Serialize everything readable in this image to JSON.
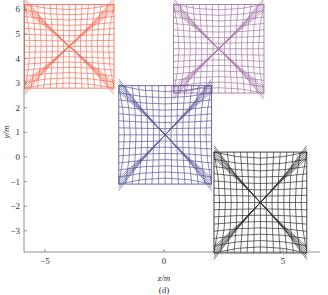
{
  "chart_data": {
    "type": "scatter",
    "title": "",
    "caption": "(d)",
    "xlabel": "z/m",
    "ylabel": "y/m",
    "xlim": [
      -6.0,
      6.5
    ],
    "ylim": [
      -3.9,
      6.2
    ],
    "xticks": [
      -5,
      0,
      5
    ],
    "xtick_labels": [
      "-5",
      "0",
      "5"
    ],
    "yticks": [
      -3,
      -2,
      -1,
      0,
      1,
      2,
      3,
      4,
      5,
      6
    ],
    "ytick_labels": [
      "-3",
      "-2",
      "-1",
      "0",
      "1",
      "2",
      "3",
      "4",
      "5",
      "6"
    ],
    "grid": false,
    "legend": null,
    "series": [
      {
        "name": "red-structure",
        "color": "#f0634a",
        "x_range": [
          -6.0,
          -2.1
        ],
        "y_range": [
          2.8,
          6.2
        ]
      },
      {
        "name": "purple-structure",
        "color": "#9b6a9c",
        "x_range": [
          0.4,
          4.2
        ],
        "y_range": [
          2.6,
          6.2
        ]
      },
      {
        "name": "blue-structure",
        "color": "#46478f",
        "x_range": [
          -1.9,
          2.0
        ],
        "y_range": [
          -1.1,
          2.9
        ]
      },
      {
        "name": "black-structure",
        "color": "#1a1a1a",
        "x_range": [
          2.1,
          6.0
        ],
        "y_range": [
          -3.9,
          0.2
        ]
      }
    ]
  }
}
